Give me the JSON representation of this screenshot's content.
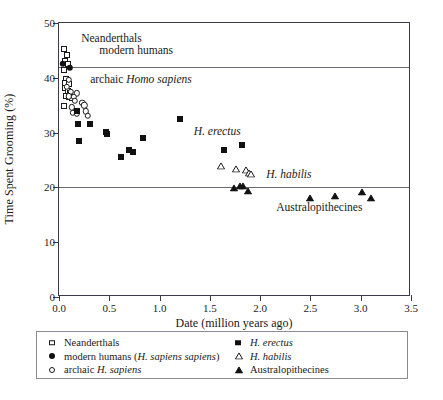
{
  "chart_data": {
    "type": "scatter",
    "title": "",
    "xlabel": "Date (million years ago)",
    "ylabel": "Time Spent Grooming (%)",
    "xlim": [
      0.0,
      3.5
    ],
    "ylim": [
      0,
      50
    ],
    "xticks": [
      "0.0",
      "0.5",
      "1.0",
      "1.5",
      "2.0",
      "2.5",
      "3.0",
      "3.5"
    ],
    "xtick_values": [
      0.0,
      0.5,
      1.0,
      1.5,
      2.0,
      2.5,
      3.0,
      3.5
    ],
    "yticks": [
      "0",
      "10",
      "20",
      "30",
      "40",
      "50"
    ],
    "ytick_values": [
      0,
      10,
      20,
      30,
      40,
      50
    ],
    "grid": false,
    "reference_lines": [
      42,
      20
    ],
    "legend_position": "below-axes",
    "series": [
      {
        "name": "Neanderthals",
        "marker": "open-square",
        "color": "#1a1a1a",
        "points": [
          [
            0.045,
            45.2
          ],
          [
            0.075,
            44.1
          ],
          [
            0.055,
            43.0
          ],
          [
            0.085,
            42.6
          ],
          [
            0.05,
            41.4
          ],
          [
            0.07,
            39.7
          ],
          [
            0.06,
            39.0
          ],
          [
            0.095,
            38.9
          ],
          [
            0.055,
            38.2
          ],
          [
            0.085,
            37.6
          ],
          [
            0.11,
            37.3
          ],
          [
            0.065,
            36.7
          ],
          [
            0.1,
            36.5
          ],
          [
            0.13,
            36.3
          ],
          [
            0.05,
            34.9
          ]
        ]
      },
      {
        "name": "modern humans (H. sapiens sapiens)",
        "marker": "filled-circle",
        "color": "#111111",
        "points": [
          [
            0.04,
            42.5
          ],
          [
            0.105,
            41.8
          ]
        ]
      },
      {
        "name": "archaic H. sapiens",
        "marker": "open-circle",
        "color": "#1a1a1a",
        "points": [
          [
            0.095,
            39.6
          ],
          [
            0.08,
            38.4
          ],
          [
            0.12,
            37.4
          ],
          [
            0.175,
            37.2
          ],
          [
            0.1,
            36.6
          ],
          [
            0.145,
            36.5
          ],
          [
            0.155,
            35.8
          ],
          [
            0.125,
            34.6
          ],
          [
            0.135,
            33.6
          ],
          [
            0.175,
            33.4
          ],
          [
            0.23,
            35.4
          ],
          [
            0.25,
            35.0
          ],
          [
            0.265,
            33.9
          ],
          [
            0.285,
            33.1
          ]
        ]
      },
      {
        "name": "H. erectus",
        "marker": "filled-square",
        "color": "#111111",
        "points": [
          [
            0.18,
            34.0
          ],
          [
            0.185,
            31.5
          ],
          [
            0.2,
            28.4
          ],
          [
            0.31,
            31.5
          ],
          [
            0.47,
            30.2
          ],
          [
            0.48,
            29.8
          ],
          [
            0.62,
            25.6
          ],
          [
            0.7,
            26.9
          ],
          [
            0.735,
            26.4
          ],
          [
            0.84,
            29.1
          ],
          [
            1.205,
            32.4
          ],
          [
            1.64,
            26.8
          ],
          [
            1.82,
            27.7
          ]
        ]
      },
      {
        "name": "H. habilis",
        "marker": "open-triangle",
        "color": "#1a1a1a",
        "points": [
          [
            1.61,
            23.9
          ],
          [
            1.76,
            23.3
          ],
          [
            1.855,
            23.2
          ],
          [
            1.89,
            22.7
          ],
          [
            1.905,
            22.4
          ]
        ]
      },
      {
        "name": "Australopithecines",
        "marker": "filled-triangle",
        "color": "#111111",
        "points": [
          [
            1.74,
            19.8
          ],
          [
            1.8,
            20.2
          ],
          [
            1.83,
            20.2
          ],
          [
            1.88,
            19.4
          ],
          [
            2.5,
            18.0
          ],
          [
            2.74,
            18.4
          ],
          [
            3.01,
            19.2
          ],
          [
            3.105,
            18.0
          ]
        ]
      }
    ],
    "annotations": [
      {
        "text": "Neanderthals",
        "x": 0.22,
        "y": 47.0,
        "italic": false
      },
      {
        "text": "modern humans",
        "x": 0.4,
        "y": 44.9,
        "italic": false
      },
      {
        "text_plain": "archaic ",
        "text_italic": "Homo sapiens",
        "x": 0.31,
        "y": 39.6
      },
      {
        "text_italic": "H. erectus",
        "x": 1.34,
        "y": 30.2
      },
      {
        "text_italic": "H. habilis",
        "x": 2.06,
        "y": 22.2
      },
      {
        "text": "Australopithecines",
        "x": 2.16,
        "y": 16.3,
        "italic": false
      }
    ]
  },
  "annotations_display": {
    "neanderthals": "Neanderthals",
    "modern_humans": "modern humans",
    "archaic_plain": "archaic ",
    "archaic_italic": "Homo sapiens",
    "h_erectus": "H. erectus",
    "h_habilis": "H. habilis",
    "australopithecines": "Australopithecines"
  },
  "axis": {
    "xlabel": "Date (million years ago)",
    "ylabel": "Time Spent Grooming (%)"
  },
  "legend": {
    "left_column": [
      {
        "marker": "open-square",
        "label_plain": "Neanderthals",
        "label_italic": "",
        "label_tail": ""
      },
      {
        "marker": "filled-circle",
        "label_plain": "modern humans (",
        "label_italic": "H. sapiens sapiens",
        "label_tail": ")"
      },
      {
        "marker": "open-circle",
        "label_plain": "archaic ",
        "label_italic": "H. sapiens",
        "label_tail": ""
      }
    ],
    "right_column": [
      {
        "marker": "filled-square",
        "label_plain": "",
        "label_italic": "H. erectus",
        "label_tail": ""
      },
      {
        "marker": "open-triangle",
        "label_plain": "",
        "label_italic": "H. habilis",
        "label_tail": ""
      },
      {
        "marker": "filled-triangle",
        "label_plain": "Australopithecines",
        "label_italic": "",
        "label_tail": ""
      }
    ]
  },
  "caption": {
    "text": ""
  },
  "colors": {
    "marker": "#111111",
    "axis": "#3a3a4a",
    "reference_line": "#6b6b78"
  }
}
